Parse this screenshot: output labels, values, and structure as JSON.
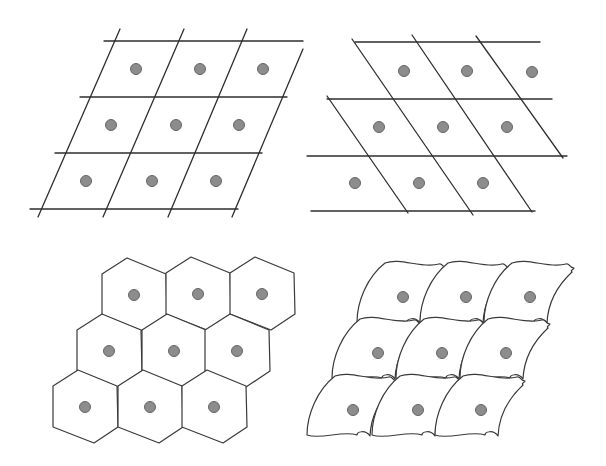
{
  "figure": {
    "colors": {
      "background": "#ffffff",
      "line": "#2e2e2e",
      "point_fill": "#8c8c8c",
      "point_stroke": "#666666"
    },
    "point_radius": 5.5,
    "panels": [
      {
        "id": "parallelogram-right-lean",
        "kind": "lines",
        "lines": [
          [
            104,
            41,
            303,
            41
          ],
          [
            80,
            97,
            287,
            97
          ],
          [
            55,
            153,
            262,
            153
          ],
          [
            30,
            209,
            238,
            209
          ],
          [
            120,
            29,
            38,
            217
          ],
          [
            184,
            29,
            103,
            217
          ],
          [
            247,
            29,
            168,
            217
          ],
          [
            303,
            49,
            232,
            217
          ]
        ],
        "points": [
          [
            136,
            69
          ],
          [
            200,
            69
          ],
          [
            263,
            69
          ],
          [
            111,
            125
          ],
          [
            176,
            125
          ],
          [
            239,
            125
          ],
          [
            86,
            181
          ],
          [
            152,
            181
          ],
          [
            216,
            181
          ]
        ]
      },
      {
        "id": "parallelogram-left-lean",
        "kind": "lines",
        "lines": [
          [
            355,
            42,
            540,
            42
          ],
          [
            327,
            99,
            552,
            99
          ],
          [
            307,
            156,
            567,
            156
          ],
          [
            311,
            211,
            535,
            211
          ],
          [
            327,
            96,
            408,
            213
          ],
          [
            352,
            39,
            473,
            215
          ],
          [
            412,
            35,
            532,
            212
          ],
          [
            476,
            36,
            563,
            158
          ]
        ],
        "points": [
          [
            404,
            71
          ],
          [
            467,
            71
          ],
          [
            532,
            72
          ],
          [
            379,
            127
          ],
          [
            443,
            127
          ],
          [
            507,
            127
          ],
          [
            355,
            183
          ],
          [
            419,
            183
          ],
          [
            483,
            183
          ]
        ]
      },
      {
        "id": "hexagonal-cells",
        "kind": "hexagons",
        "hexagon": [
          [
            -7,
            -37
          ],
          [
            32,
            -21
          ],
          [
            33,
            20
          ],
          [
            9,
            36
          ],
          [
            -32,
            20
          ],
          [
            -32,
            -21
          ]
        ],
        "points": [
          [
            134,
            295
          ],
          [
            198,
            294
          ],
          [
            262,
            294
          ],
          [
            109,
            351
          ],
          [
            174,
            351
          ],
          [
            237,
            351
          ],
          [
            85,
            407
          ],
          [
            150,
            407
          ],
          [
            214,
            407
          ]
        ]
      },
      {
        "id": "curved-cells",
        "kind": "curved",
        "tile_path": "M -18 -34 C -2 -40, 18 -28, 36 -33 C 40 -34, 38 -30, 44 -29 C 43 -27, 40 -27, 42 -25 C 28 -12, 18 4, 17 26 C 12 19, 4 22, 4 25 C -10 20, -32 30, -46 25 C -46 5, -36 -20, -18 -34 Z",
        "points": [
          [
            403,
            297
          ],
          [
            466,
            297
          ],
          [
            530,
            297
          ],
          [
            378,
            353
          ],
          [
            442,
            353
          ],
          [
            506,
            353
          ],
          [
            353,
            410
          ],
          [
            418,
            410
          ],
          [
            481,
            410
          ]
        ]
      }
    ]
  }
}
